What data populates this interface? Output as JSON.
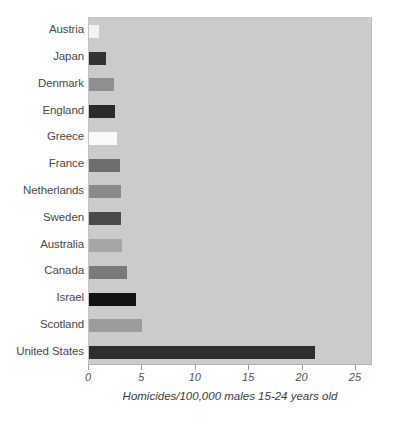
{
  "chart_data": {
    "type": "bar",
    "orientation": "horizontal",
    "title": "",
    "xlabel": "Homicides/100,000 males 15-24 years old",
    "ylabel": "",
    "categories": [
      "Austria",
      "Japan",
      "Denmark",
      "England",
      "Greece",
      "France",
      "Netherlands",
      "Sweden",
      "Australia",
      "Canada",
      "Israel",
      "Scotland",
      "United States"
    ],
    "values": [
      0.9,
      1.6,
      2.3,
      2.4,
      2.6,
      2.9,
      3.0,
      3.0,
      3.1,
      3.6,
      4.4,
      5.0,
      21.2
    ],
    "bar_colors": [
      "#f2f2f2",
      "#333333",
      "#8f8f8f",
      "#2b2b2b",
      "#fafafa",
      "#6e6e6e",
      "#8a8a8a",
      "#4a4a4a",
      "#a6a6a6",
      "#7a7a7a",
      "#121212",
      "#9c9c9c",
      "#2e2e2e"
    ],
    "xticks": [
      0,
      5,
      10,
      15,
      20,
      25
    ],
    "xtick_labels": [
      "0",
      "5",
      "10",
      "15",
      "20",
      "25"
    ],
    "xlim": [
      0,
      26.6
    ],
    "ylim_categories": 13,
    "grid": false,
    "legend": null,
    "plot_background": "#cbcbcb",
    "figure_background": "#ffffff",
    "axis_text_color": "#4a4a4a"
  }
}
